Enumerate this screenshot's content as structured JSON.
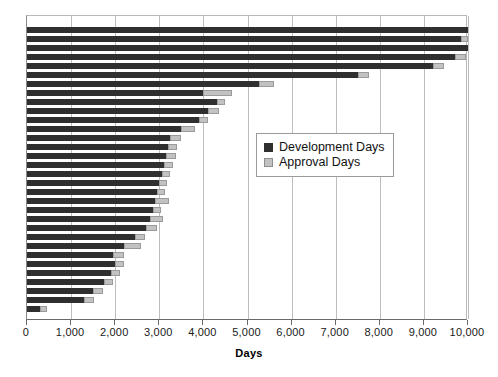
{
  "chart_data": {
    "type": "bar",
    "orientation": "horizontal",
    "stacked": true,
    "title": "",
    "xlabel": "Days",
    "ylabel": "",
    "xlim": [
      0,
      10000
    ],
    "ylim": null,
    "grid": true,
    "xticks": [
      0,
      1000,
      2000,
      3000,
      4000,
      5000,
      6000,
      7000,
      8000,
      9000,
      10000
    ],
    "xtick_labels": [
      "0",
      "1,000",
      "2,000",
      "3,000",
      "4,000",
      "5,000",
      "6,000",
      "7,000",
      "8,000",
      "9,000",
      "10,000"
    ],
    "legend_position": "center-right",
    "series": [
      {
        "name": "Development Days",
        "color": "#2f2f2f",
        "values": [
          10000,
          9850,
          10000,
          9700,
          9200,
          7500,
          5250,
          4000,
          4300,
          4100,
          3900,
          3500,
          3250,
          3200,
          3150,
          3100,
          3050,
          3000,
          2950,
          2900,
          2850,
          2800,
          2700,
          2450,
          2200,
          1950,
          2000,
          1900,
          1750,
          1500,
          1300,
          300
        ]
      },
      {
        "name": "Approval Days",
        "color": "#c2c2c2",
        "values": [
          0,
          150,
          0,
          250,
          250,
          250,
          350,
          650,
          200,
          250,
          200,
          300,
          250,
          200,
          230,
          220,
          200,
          180,
          190,
          330,
          200,
          280,
          250,
          220,
          380,
          250,
          200,
          220,
          200,
          220,
          230,
          150
        ]
      }
    ],
    "categories": [
      "1",
      "2",
      "3",
      "4",
      "5",
      "6",
      "7",
      "8",
      "9",
      "10",
      "11",
      "12",
      "13",
      "14",
      "15",
      "16",
      "17",
      "18",
      "19",
      "20",
      "21",
      "22",
      "23",
      "24",
      "25",
      "26",
      "27",
      "28",
      "29",
      "30",
      "31",
      "32"
    ]
  },
  "legend": {
    "items": [
      {
        "label": "Development Days",
        "swatch": "dev-swatch"
      },
      {
        "label": "Approval Days",
        "swatch": "app-swatch"
      }
    ]
  },
  "axis": {
    "x_title": "Days"
  }
}
